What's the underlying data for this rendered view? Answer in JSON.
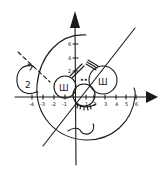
{
  "diagram": {
    "title": "",
    "ink_color": "#1a1a1a",
    "background": "#ffffff",
    "x_axis": {
      "ticks": [
        "-4",
        "-3",
        "-2",
        "-1",
        "1",
        "2",
        "3",
        "4",
        "5",
        "6"
      ]
    },
    "y_axis": {
      "ticks": [
        "6",
        "4",
        "2"
      ]
    },
    "features": {
      "left_ear_glyph": "2",
      "left_eye_glyph": "Ш",
      "right_eye_glyph": "Ш",
      "nose_eyes": "••"
    }
  }
}
